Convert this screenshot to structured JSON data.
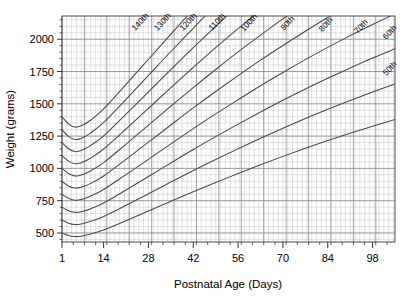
{
  "chart_data": {
    "type": "line",
    "title": "",
    "xlabel": "Postnatal Age (Days)",
    "ylabel": "Weight (grams)",
    "xlim": [
      1,
      105
    ],
    "ylim": [
      430,
      2180
    ],
    "xticks": [
      1,
      14,
      28,
      42,
      56,
      70,
      84,
      98
    ],
    "xtick_labels": [
      "1",
      "14",
      "28",
      "42",
      "56",
      "70",
      "84",
      "98"
    ],
    "yticks": [
      500,
      750,
      1000,
      1250,
      1500,
      1750,
      2000
    ],
    "ytick_labels": [
      "500",
      "750",
      "1000",
      "1250",
      "1500",
      "1750",
      "2000"
    ],
    "grid": "minor and major grid on, both axes",
    "legend": "none; curves labelled in-place along each line",
    "x": [
      1,
      3,
      5,
      7,
      10,
      14,
      21,
      28,
      35,
      42,
      49,
      56,
      63,
      70,
      77,
      84,
      91,
      98,
      105
    ],
    "series": [
      {
        "name": "140th",
        "label": "140th",
        "label_x": 26,
        "label_y": 2120,
        "values": [
          1400,
          1345,
          1320,
          1330,
          1375,
          1460,
          1650,
          1845,
          2040,
          2230,
          2420,
          2600,
          2780,
          2950,
          3110,
          3270,
          3420,
          3560,
          3700
        ]
      },
      {
        "name": "130th",
        "label": "130th",
        "label_x": 33,
        "label_y": 2120,
        "values": [
          1300,
          1248,
          1224,
          1232,
          1275,
          1356,
          1535,
          1720,
          1905,
          2085,
          2265,
          2435,
          2605,
          2765,
          2915,
          3065,
          3205,
          3340,
          3470
        ]
      },
      {
        "name": "120th",
        "label": "120th",
        "label_x": 41,
        "label_y": 2120,
        "values": [
          1200,
          1152,
          1130,
          1138,
          1178,
          1252,
          1420,
          1592,
          1765,
          1935,
          2100,
          2260,
          2415,
          2565,
          2705,
          2845,
          2975,
          3100,
          3220
        ]
      },
      {
        "name": "110th",
        "label": "110th",
        "label_x": 50,
        "label_y": 2120,
        "values": [
          1100,
          1056,
          1036,
          1043,
          1080,
          1150,
          1305,
          1465,
          1625,
          1782,
          1935,
          2082,
          2225,
          2362,
          2492,
          2620,
          2740,
          2855,
          2965
        ]
      },
      {
        "name": "100th",
        "label": "100th",
        "label_x": 60,
        "label_y": 2115,
        "values": [
          1000,
          960,
          942,
          948,
          982,
          1045,
          1188,
          1335,
          1482,
          1626,
          1766,
          1902,
          2032,
          2158,
          2278,
          2394,
          2505,
          2610,
          2710
        ]
      },
      {
        "name": "90th",
        "label": "90th",
        "label_x": 72,
        "label_y": 2110,
        "values": [
          900,
          864,
          848,
          854,
          884,
          941,
          1070,
          1203,
          1336,
          1468,
          1595,
          1718,
          1838,
          1952,
          2062,
          2168,
          2268,
          2364,
          2455
        ]
      },
      {
        "name": "80th",
        "label": "80th",
        "label_x": 84,
        "label_y": 2100,
        "values": [
          800,
          768,
          754,
          759,
          786,
          837,
          952,
          1070,
          1190,
          1308,
          1422,
          1532,
          1640,
          1743,
          1842,
          1937,
          2028,
          2114,
          2196
        ]
      },
      {
        "name": "70th",
        "label": "70th",
        "label_x": 95,
        "label_y": 2085,
        "values": [
          700,
          672,
          660,
          664,
          688,
          732,
          833,
          937,
          1042,
          1146,
          1246,
          1343,
          1437,
          1528,
          1615,
          1698,
          1778,
          1854,
          1926
        ]
      },
      {
        "name": "60th",
        "label": "60th",
        "label_x": 104,
        "label_y": 2040,
        "values": [
          600,
          576,
          566,
          570,
          590,
          628,
          714,
          804,
          894,
          983,
          1069,
          1152,
          1233,
          1311,
          1386,
          1458,
          1526,
          1591,
          1653
        ]
      },
      {
        "name": "50th",
        "label": "50th",
        "label_x": 104,
        "label_y": 1760,
        "values": [
          500,
          480,
          472,
          475,
          492,
          523,
          595,
          670,
          745,
          819,
          891,
          960,
          1028,
          1093,
          1155,
          1215,
          1272,
          1326,
          1378
        ]
      }
    ]
  },
  "colors": {
    "curve": "#4a4a4a",
    "grid_minor": "#b9b9b9",
    "grid_major": "#8a8a8a",
    "frame": "#4a4a4a",
    "text": "#000000",
    "background": "#ffffff"
  }
}
